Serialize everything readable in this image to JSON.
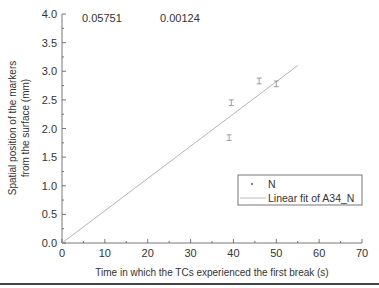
{
  "chart_data": {
    "type": "scatter",
    "title": "",
    "xlabel": "Time in which the TCs experienced the first break (s)",
    "ylabel_line1": "Spatial position of the markers",
    "ylabel_line2": "from the surface (mm)",
    "xlim": [
      0,
      70
    ],
    "ylim": [
      0.0,
      4.0
    ],
    "x_ticks": [
      "0",
      "10",
      "20",
      "30",
      "40",
      "50",
      "60",
      "70"
    ],
    "y_ticks": [
      "0.0",
      "0.5",
      "1.0",
      "1.5",
      "2.0",
      "2.5",
      "3.0",
      "3.5",
      "4.0"
    ],
    "grid": false,
    "legend_position": "lower right",
    "annotations": [
      "0.05751",
      "0.00124"
    ],
    "series": [
      {
        "name": "N",
        "kind": "scatter-with-error-bars",
        "points": [
          {
            "x": 39,
            "y": 1.84,
            "err": 0.05
          },
          {
            "x": 39.5,
            "y": 2.45,
            "err": 0.05
          },
          {
            "x": 46,
            "y": 2.83,
            "err": 0.05
          },
          {
            "x": 50,
            "y": 2.78,
            "err": 0.05
          }
        ]
      },
      {
        "name": "Linear fit of A34_N",
        "kind": "line",
        "slope": 0.05751,
        "points": [
          {
            "x": 0,
            "y": 0.0
          },
          {
            "x": 55,
            "y": 3.1
          }
        ]
      }
    ]
  },
  "legend": {
    "items": [
      "N",
      "Linear fit of A34_N"
    ]
  }
}
